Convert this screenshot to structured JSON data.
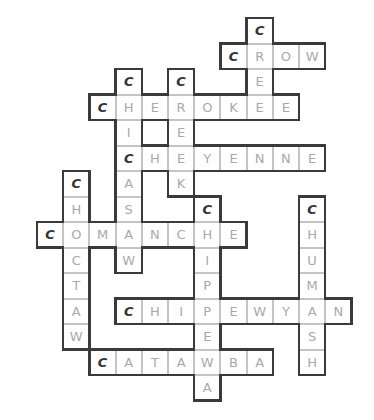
{
  "puzzle": {
    "type": "crossword",
    "grid": {
      "x0": 37,
      "y0": 18,
      "cell_w": 26.2,
      "cell_h": 25.5
    },
    "colors": {
      "outline": "#3a3a3a",
      "inner_line": "#c4c4c4",
      "letter": "#a9a9a9",
      "first_letter": "#333333"
    },
    "words": [
      {
        "word": "CROW",
        "dir": "across",
        "row": 1,
        "col": 7
      },
      {
        "word": "CREE",
        "dir": "down",
        "row": 0,
        "col": 8
      },
      {
        "word": "CHEROKEE",
        "dir": "across",
        "row": 3,
        "col": 2
      },
      {
        "word": "CHICASAW",
        "dir": "down",
        "row": 2,
        "col": 3
      },
      {
        "word": "CREEK",
        "dir": "down",
        "row": 2,
        "col": 5
      },
      {
        "word": "CHEYENNE",
        "dir": "across",
        "row": 5,
        "col": 3
      },
      {
        "word": "CHOCTAW",
        "dir": "down",
        "row": 6,
        "col": 1
      },
      {
        "word": "COMANCHE",
        "dir": "across",
        "row": 8,
        "col": 0
      },
      {
        "word": "CHIPPEWA",
        "dir": "down",
        "row": 7,
        "col": 6
      },
      {
        "word": "CHUMASH",
        "dir": "down",
        "row": 7,
        "col": 10
      },
      {
        "word": "CHIPEWYAN",
        "dir": "across",
        "row": 11,
        "col": 3
      },
      {
        "word": "CATAWBA",
        "dir": "across",
        "row": 13,
        "col": 2
      }
    ]
  }
}
